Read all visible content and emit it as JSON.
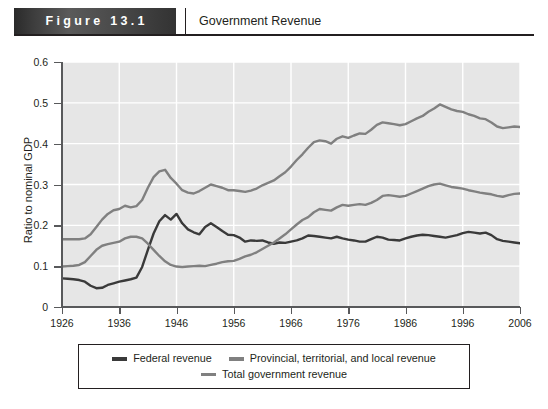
{
  "header": {
    "figure_label": "Figure 13.1",
    "title": "Government Revenue",
    "divider_icon": "vertical-divider-icon"
  },
  "chart_data": {
    "type": "line",
    "title": "Government Revenue",
    "xlabel": "",
    "ylabel": "Ratio to nominal GDP",
    "xlim": [
      1926,
      2006
    ],
    "ylim": [
      0,
      0.6
    ],
    "ytick_labels": [
      "0",
      "0.1",
      "0.2",
      "0.3",
      "0.4",
      "0.5",
      "0.6"
    ],
    "ytick_values": [
      0,
      0.1,
      0.2,
      0.3,
      0.4,
      0.5,
      0.6
    ],
    "xtick_labels": [
      "1926",
      "1936",
      "1946",
      "1956",
      "1966",
      "1976",
      "1986",
      "1996",
      "2006"
    ],
    "xtick_values": [
      1926,
      1936,
      1946,
      1956,
      1966,
      1976,
      1986,
      1996,
      2006
    ],
    "grid": true,
    "grid_color": "#ffffff",
    "plot_background": "#e6e6e6",
    "legend_position": "below",
    "x": [
      1926,
      1927,
      1928,
      1929,
      1930,
      1931,
      1932,
      1933,
      1934,
      1935,
      1936,
      1937,
      1938,
      1939,
      1940,
      1941,
      1942,
      1943,
      1944,
      1945,
      1946,
      1947,
      1948,
      1949,
      1950,
      1951,
      1952,
      1953,
      1954,
      1955,
      1956,
      1957,
      1958,
      1959,
      1960,
      1961,
      1962,
      1963,
      1964,
      1965,
      1966,
      1967,
      1968,
      1969,
      1970,
      1971,
      1972,
      1973,
      1974,
      1975,
      1976,
      1977,
      1978,
      1979,
      1980,
      1981,
      1982,
      1983,
      1984,
      1985,
      1986,
      1987,
      1988,
      1989,
      1990,
      1991,
      1992,
      1993,
      1994,
      1995,
      1996,
      1997,
      1998,
      1999,
      2000,
      2001,
      2002,
      2003,
      2004,
      2005,
      2006
    ],
    "series": [
      {
        "name": "Federal revenue",
        "color": "#3a3a3a",
        "values": [
          0.07,
          0.069,
          0.068,
          0.066,
          0.062,
          0.052,
          0.046,
          0.047,
          0.054,
          0.058,
          0.062,
          0.065,
          0.068,
          0.072,
          0.098,
          0.14,
          0.18,
          0.21,
          0.225,
          0.214,
          0.228,
          0.205,
          0.19,
          0.183,
          0.178,
          0.196,
          0.205,
          0.196,
          0.186,
          0.177,
          0.176,
          0.17,
          0.16,
          0.163,
          0.162,
          0.163,
          0.158,
          0.155,
          0.158,
          0.157,
          0.16,
          0.163,
          0.168,
          0.175,
          0.174,
          0.172,
          0.17,
          0.168,
          0.172,
          0.168,
          0.165,
          0.163,
          0.16,
          0.16,
          0.166,
          0.172,
          0.17,
          0.165,
          0.164,
          0.163,
          0.168,
          0.172,
          0.175,
          0.177,
          0.176,
          0.174,
          0.172,
          0.17,
          0.173,
          0.176,
          0.181,
          0.184,
          0.182,
          0.18,
          0.182,
          0.176,
          0.166,
          0.162,
          0.16,
          0.158,
          0.156
        ]
      },
      {
        "name": "Provincial, territorial, and local revenue",
        "color": "#808080",
        "values": [
          0.099,
          0.1,
          0.101,
          0.103,
          0.11,
          0.125,
          0.14,
          0.15,
          0.154,
          0.157,
          0.16,
          0.168,
          0.172,
          0.172,
          0.168,
          0.155,
          0.14,
          0.125,
          0.112,
          0.103,
          0.099,
          0.098,
          0.099,
          0.1,
          0.101,
          0.1,
          0.103,
          0.106,
          0.11,
          0.112,
          0.113,
          0.118,
          0.124,
          0.128,
          0.134,
          0.142,
          0.15,
          0.158,
          0.168,
          0.178,
          0.19,
          0.202,
          0.213,
          0.22,
          0.232,
          0.24,
          0.238,
          0.236,
          0.244,
          0.25,
          0.248,
          0.25,
          0.252,
          0.25,
          0.255,
          0.262,
          0.272,
          0.274,
          0.272,
          0.27,
          0.272,
          0.278,
          0.284,
          0.29,
          0.296,
          0.3,
          0.302,
          0.298,
          0.294,
          0.292,
          0.29,
          0.286,
          0.283,
          0.28,
          0.278,
          0.276,
          0.272,
          0.27,
          0.274,
          0.277,
          0.278
        ]
      },
      {
        "name": "Total government revenue",
        "color": "#808080",
        "values": [
          0.166,
          0.166,
          0.166,
          0.166,
          0.168,
          0.178,
          0.196,
          0.214,
          0.228,
          0.237,
          0.24,
          0.248,
          0.244,
          0.247,
          0.262,
          0.292,
          0.318,
          0.332,
          0.336,
          0.316,
          0.302,
          0.286,
          0.28,
          0.278,
          0.284,
          0.292,
          0.3,
          0.296,
          0.292,
          0.286,
          0.286,
          0.284,
          0.282,
          0.285,
          0.29,
          0.298,
          0.304,
          0.31,
          0.32,
          0.33,
          0.344,
          0.36,
          0.374,
          0.39,
          0.404,
          0.408,
          0.406,
          0.4,
          0.412,
          0.418,
          0.414,
          0.42,
          0.425,
          0.424,
          0.434,
          0.446,
          0.452,
          0.45,
          0.448,
          0.445,
          0.448,
          0.455,
          0.462,
          0.468,
          0.478,
          0.486,
          0.496,
          0.49,
          0.484,
          0.48,
          0.478,
          0.472,
          0.468,
          0.462,
          0.46,
          0.452,
          0.442,
          0.438,
          0.44,
          0.442,
          0.441
        ]
      }
    ]
  },
  "legend": {
    "items": [
      {
        "label": "Federal revenue",
        "color": "#3a3a3a"
      },
      {
        "label": "Provincial, territorial, and local revenue",
        "color": "#808080"
      },
      {
        "label": "Total government revenue",
        "color": "#808080"
      }
    ]
  }
}
